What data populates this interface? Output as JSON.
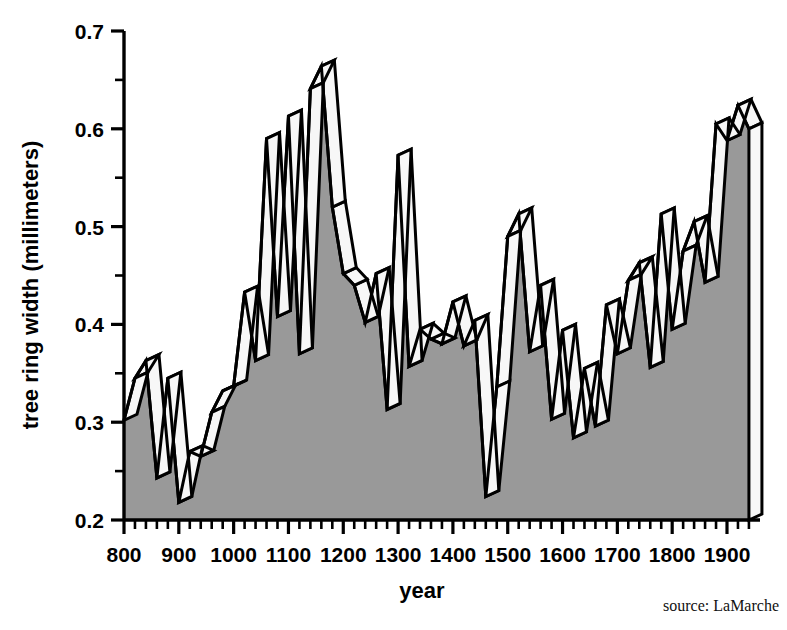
{
  "chart_data": {
    "type": "area",
    "title": "",
    "xlabel": "year",
    "ylabel": "tree ring width (millimeters)",
    "xlim": [
      800,
      1962
    ],
    "ylim": [
      0.2,
      0.7
    ],
    "xtick_labels": [
      "800",
      "900",
      "1000",
      "1100",
      "1200",
      "1300",
      "1400",
      "1500",
      "1600",
      "1700",
      "1800",
      "1900"
    ],
    "xticks": [
      800,
      900,
      1000,
      1100,
      1200,
      1300,
      1400,
      1500,
      1600,
      1700,
      1800,
      1900
    ],
    "xtick_minor_step": 20,
    "ytick_labels": [
      "0.2",
      "0.3",
      "0.4",
      "0.5",
      "0.6",
      "0.7"
    ],
    "yticks": [
      0.2,
      0.3,
      0.4,
      0.5,
      0.6,
      0.7
    ],
    "ytick_minor_step": 0.05,
    "grid": false,
    "legend": "none",
    "style": "3d-extruded-area",
    "fill_color": "#999999",
    "side_face_color": "#f7f7f7",
    "line_color": "#000000",
    "annotations": [
      "source: LaMarche"
    ],
    "x": [
      800,
      820,
      840,
      860,
      880,
      900,
      920,
      940,
      960,
      980,
      1000,
      1020,
      1040,
      1060,
      1080,
      1100,
      1120,
      1140,
      1160,
      1180,
      1200,
      1220,
      1240,
      1260,
      1280,
      1300,
      1320,
      1340,
      1360,
      1380,
      1400,
      1420,
      1440,
      1460,
      1480,
      1500,
      1520,
      1540,
      1560,
      1580,
      1600,
      1620,
      1640,
      1660,
      1680,
      1700,
      1720,
      1740,
      1760,
      1780,
      1800,
      1820,
      1840,
      1860,
      1880,
      1900,
      1920,
      1940
    ],
    "y": [
      0.302,
      0.345,
      0.363,
      0.243,
      0.345,
      0.218,
      0.27,
      0.265,
      0.31,
      0.332,
      0.337,
      0.433,
      0.363,
      0.59,
      0.408,
      0.613,
      0.37,
      0.641,
      0.664,
      0.52,
      0.452,
      0.44,
      0.402,
      0.452,
      0.313,
      0.573,
      0.357,
      0.395,
      0.385,
      0.38,
      0.423,
      0.378,
      0.404,
      0.224,
      0.336,
      0.49,
      0.513,
      0.372,
      0.44,
      0.303,
      0.394,
      0.284,
      0.355,
      0.296,
      0.42,
      0.37,
      0.445,
      0.463,
      0.356,
      0.513,
      0.395,
      0.475,
      0.505,
      0.443,
      0.605,
      0.588,
      0.624,
      0.6
    ],
    "values_note": "tree ring width in millimeters per 20-year interval"
  },
  "axes": {
    "x_axis_label": "year",
    "y_axis_label": "tree ring width (millimeters)"
  },
  "footer": {
    "source": "source: LaMarche"
  }
}
